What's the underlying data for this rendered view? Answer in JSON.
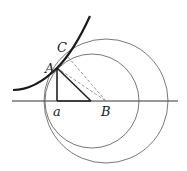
{
  "figure": {
    "width": 187,
    "height": 171,
    "labels": {
      "A": "A",
      "C": "C",
      "a": "a",
      "B": "B"
    },
    "colors": {
      "curve": "#1a1a1a",
      "thin": "#555555",
      "dashed": "#777777",
      "triangle": "#222222"
    },
    "points": {
      "A": [
        57,
        68
      ],
      "C": [
        68,
        57
      ],
      "a": [
        57,
        101
      ],
      "N": [
        91,
        101
      ],
      "B": [
        106,
        101
      ]
    },
    "circles": [
      {
        "name": "outer-circle",
        "cx": 106,
        "cy": 101,
        "r": 62
      },
      {
        "name": "inner-circle",
        "cx": 92,
        "cy": 101,
        "r": 47
      }
    ],
    "baseline": {
      "x1": 12,
      "x2": 178,
      "y": 101
    }
  }
}
